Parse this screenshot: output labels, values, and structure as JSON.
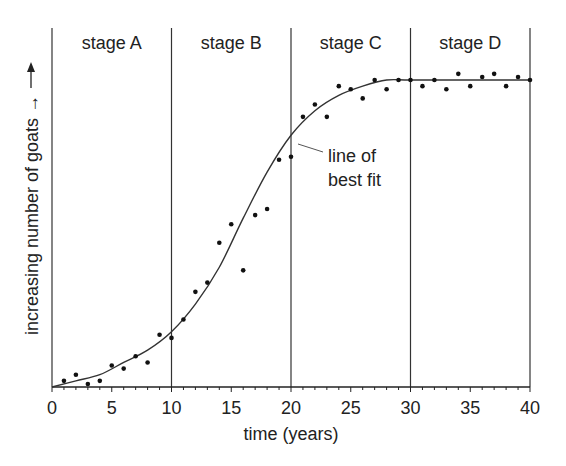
{
  "chart_data": {
    "type": "scatter",
    "title": "",
    "xlabel": "time (years)",
    "ylabel": "increasing number of goats →",
    "xlim": [
      0,
      40
    ],
    "ylim": [
      0,
      100
    ],
    "x_ticks": [
      0,
      5,
      10,
      15,
      20,
      25,
      30,
      35,
      40
    ],
    "x_tick_labels": [
      "0",
      "5",
      "10",
      "15",
      "20",
      "25",
      "30",
      "35",
      "40"
    ],
    "stages": [
      {
        "label": "stage A",
        "from": 0,
        "to": 10
      },
      {
        "label": "stage B",
        "from": 10,
        "to": 20
      },
      {
        "label": "stage C",
        "from": 20,
        "to": 30
      },
      {
        "label": "stage D",
        "from": 30,
        "to": 40
      }
    ],
    "annotation": {
      "text_line1": "line of",
      "text_line2": "best fit",
      "points_to_x": 20
    },
    "series": [
      {
        "name": "observed goats",
        "x": [
          1,
          2,
          3,
          4,
          5,
          6,
          7,
          8,
          9,
          10,
          11,
          12,
          13,
          14,
          15,
          16,
          17,
          18,
          19,
          20,
          21,
          22,
          23,
          24,
          25,
          26,
          27,
          28,
          29,
          30,
          31,
          32,
          33,
          34,
          35,
          36,
          37,
          38,
          39,
          40
        ],
        "values": [
          2,
          4,
          1,
          2,
          7,
          6,
          10,
          8,
          17,
          16,
          22,
          31,
          34,
          47,
          53,
          38,
          56,
          58,
          74,
          75,
          88,
          92,
          88,
          98,
          97,
          94,
          100,
          97,
          100,
          100,
          98,
          100,
          97,
          102,
          98,
          101,
          102,
          98,
          101,
          100
        ]
      },
      {
        "name": "line of best fit",
        "x": [
          0,
          2,
          4,
          6,
          8,
          10,
          12,
          14,
          16,
          18,
          20,
          22,
          24,
          26,
          28,
          30,
          35,
          40
        ],
        "values": [
          0,
          2,
          4,
          8,
          12,
          18,
          27,
          39,
          55,
          70,
          82,
          90,
          95,
          98,
          100,
          100,
          100,
          100
        ]
      }
    ],
    "grid": false,
    "legend": "none"
  }
}
